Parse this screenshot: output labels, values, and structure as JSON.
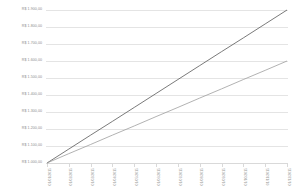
{
  "chart_data": {
    "type": "line",
    "title": "",
    "subtitle": "",
    "xlabel": "",
    "ylabel": "",
    "grid": true,
    "legend": "none",
    "ylim": [
      1000,
      1900
    ],
    "ytick_labels": [
      "R$ 1.900,00",
      "R$ 1.800,00",
      "R$ 1.700,00",
      "R$ 1.600,00",
      "R$ 1.500,00",
      "R$ 1.400,00",
      "R$ 1.300,00",
      "R$ 1.200,00",
      "R$ 1.100,00",
      "R$ 1.000,00"
    ],
    "ytick_values": [
      1900,
      1800,
      1700,
      1600,
      1500,
      1400,
      1300,
      1200,
      1100,
      1000
    ],
    "categories": [
      "01/01/2015",
      "01/02/2015",
      "01/03/2015",
      "01/04/2015",
      "01/05/2015",
      "01/06/2015",
      "01/07/2015",
      "01/08/2015",
      "01/09/2015",
      "01/10/2015",
      "01/11/2015",
      "01/12/2015"
    ],
    "series": [
      {
        "name": "Serie 1",
        "color": "#585858",
        "values": [
          1000,
          1082,
          1164,
          1245,
          1327,
          1409,
          1491,
          1573,
          1655,
          1736,
          1818,
          1900
        ]
      },
      {
        "name": "Serie 2",
        "color": "#9e9e9e",
        "values": [
          1000,
          1055,
          1109,
          1164,
          1218,
          1273,
          1327,
          1382,
          1436,
          1491,
          1545,
          1600
        ]
      }
    ]
  },
  "colors": {
    "background": "#ffffff",
    "gridline": "#e4e4e4",
    "axis": "#d9d9d9",
    "tick_text": "#8c8c8c",
    "series_1": "#585858",
    "series_2": "#9e9e9e"
  }
}
